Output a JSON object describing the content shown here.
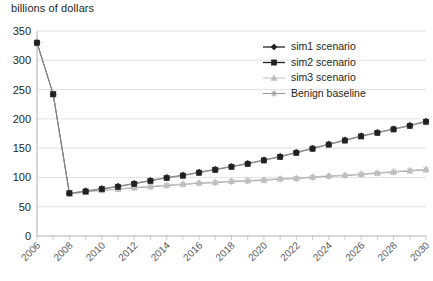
{
  "chart_data": {
    "type": "line",
    "title": "",
    "ylabel": "billions of dollars",
    "xlabel": "",
    "ylim": [
      0,
      350
    ],
    "ytick_values": [
      0,
      50,
      100,
      150,
      200,
      250,
      300,
      350
    ],
    "ytick_labels": [
      "0",
      "50",
      "100",
      "150",
      "200",
      "250",
      "300",
      "350"
    ],
    "grid": true,
    "legend_position": "upper-right",
    "x": [
      2006,
      2007,
      2008,
      2009,
      2010,
      2011,
      2012,
      2013,
      2014,
      2015,
      2016,
      2017,
      2018,
      2019,
      2020,
      2021,
      2022,
      2023,
      2024,
      2025,
      2026,
      2027,
      2028,
      2029,
      2030
    ],
    "xtick_labels": [
      "2006",
      "2008",
      "2010",
      "2012",
      "2014",
      "2016",
      "2018",
      "2020",
      "2022",
      "2024",
      "2026",
      "2028",
      "2030"
    ],
    "xtick_values": [
      2006,
      2008,
      2010,
      2012,
      2014,
      2016,
      2018,
      2020,
      2022,
      2024,
      2026,
      2028,
      2030
    ],
    "series": [
      {
        "name": "sim1 scenario",
        "marker": "diamond",
        "color": "#231f20",
        "values": [
          330,
          242,
          73,
          77,
          81,
          85,
          90,
          95,
          100,
          104,
          109,
          114,
          119,
          124,
          130,
          136,
          143,
          150,
          157,
          164,
          171,
          177,
          183,
          189,
          196
        ]
      },
      {
        "name": "sim2 scenario",
        "marker": "square",
        "color": "#231f20",
        "values": [
          330,
          242,
          73,
          76,
          80,
          84,
          89,
          94,
          99,
          103,
          108,
          113,
          118,
          123,
          129,
          135,
          142,
          149,
          156,
          163,
          170,
          176,
          182,
          188,
          195
        ]
      },
      {
        "name": "sim3 scenario",
        "marker": "triangle",
        "color": "#bfbfbf",
        "values": [
          330,
          242,
          72,
          75,
          78,
          80,
          83,
          85,
          87,
          89,
          91,
          92,
          94,
          95,
          96,
          98,
          99,
          101,
          103,
          104,
          106,
          108,
          110,
          112,
          114
        ]
      },
      {
        "name": "Benign baseline",
        "marker": "asterisk",
        "color": "#969696",
        "values": [
          330,
          242,
          72,
          75,
          78,
          80,
          82,
          84,
          86,
          88,
          90,
          91,
          93,
          94,
          95,
          97,
          98,
          100,
          102,
          103,
          105,
          107,
          109,
          111,
          113
        ]
      }
    ]
  },
  "legend": {
    "items": [
      {
        "label": "sim1 scenario"
      },
      {
        "label": "sim2 scenario"
      },
      {
        "label": "sim3 scenario"
      },
      {
        "label": "Benign baseline"
      }
    ]
  },
  "colors": {
    "dark": "#231f20",
    "light_gray": "#bfbfbf",
    "mid_gray": "#969696",
    "grid": "#d9d9d9",
    "axis": "#a6a6a6"
  }
}
